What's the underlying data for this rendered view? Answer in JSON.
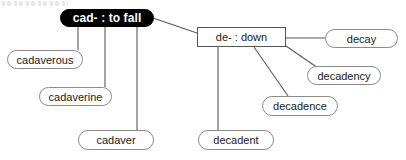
{
  "diagram": {
    "type": "word-family-tree",
    "title_artifact": "",
    "root": {
      "id": "root",
      "label": "cad- : to fall",
      "shape": "rounded-pill",
      "fill": "#000000",
      "text_color": "#ffffff",
      "x": 60,
      "y": 9,
      "w": 94,
      "h": 18
    },
    "branch": {
      "id": "branch-de",
      "label": "de- : down",
      "shape": "rectangle",
      "fill": "#ffffff",
      "text_color": "#1a1a1a",
      "x": 197,
      "y": 27,
      "w": 89,
      "h": 20
    },
    "leaves": [
      {
        "id": "cadaverous",
        "label": "cadaverous",
        "shape": "rounded-pill",
        "x": 7,
        "y": 50,
        "w": 76,
        "h": 19,
        "parent": "root"
      },
      {
        "id": "cadaverine",
        "label": "cadaverine",
        "shape": "rounded-pill",
        "x": 39,
        "y": 87,
        "w": 73,
        "h": 19,
        "parent": "root"
      },
      {
        "id": "cadaver",
        "label": "cadaver",
        "shape": "rounded-pill",
        "x": 78,
        "y": 130,
        "w": 76,
        "h": 20,
        "parent": "root"
      },
      {
        "id": "decay",
        "label": "decay",
        "shape": "rounded-pill",
        "x": 325,
        "y": 29,
        "w": 73,
        "h": 19,
        "parent": "branch-de"
      },
      {
        "id": "decadency",
        "label": "decadency",
        "shape": "rounded-pill",
        "x": 307,
        "y": 66,
        "w": 74,
        "h": 19,
        "parent": "branch-de"
      },
      {
        "id": "decadence",
        "label": "decadence",
        "shape": "rounded-pill",
        "x": 262,
        "y": 96,
        "w": 76,
        "h": 20,
        "parent": "branch-de"
      },
      {
        "id": "decadent",
        "label": "decadent",
        "shape": "rounded-pill",
        "x": 198,
        "y": 130,
        "w": 76,
        "h": 20,
        "parent": "branch-de"
      }
    ],
    "edges": [
      {
        "from": "root",
        "to": "cadaverous",
        "x1": 78,
        "y1": 26,
        "x2": 78,
        "y2": 50
      },
      {
        "from": "root",
        "to": "cadaverine",
        "x1": 105,
        "y1": 26,
        "x2": 105,
        "y2": 87
      },
      {
        "from": "root",
        "to": "cadaver",
        "x1": 137,
        "y1": 26,
        "x2": 137,
        "y2": 130
      },
      {
        "from": "root",
        "to": "branch-de",
        "x1": 153,
        "y1": 18,
        "x2": 197,
        "y2": 33
      },
      {
        "from": "branch-de",
        "to": "decadent",
        "x1": 218,
        "y1": 47,
        "x2": 218,
        "y2": 130
      },
      {
        "from": "branch-de",
        "to": "decadence",
        "x1": 254,
        "y1": 47,
        "x2": 288,
        "y2": 96
      },
      {
        "from": "branch-de",
        "to": "decay",
        "x1": 286,
        "y1": 38,
        "x2": 327,
        "y2": 38
      },
      {
        "from": "branch-de",
        "to": "decadency",
        "x1": 286,
        "y1": 46,
        "x2": 318,
        "y2": 68
      }
    ],
    "colors": {
      "root_fill": "#000000",
      "root_text": "#ffffff",
      "node_fill": "#ffffff",
      "node_stroke": "#8a8a8a",
      "rect_stroke": "#555555",
      "edge_stroke": "#595959",
      "background": "#ffffff"
    }
  }
}
